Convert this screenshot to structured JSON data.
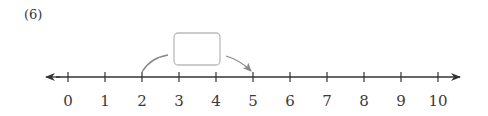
{
  "problem": {
    "number": "(6)"
  },
  "number_line": {
    "min": 0,
    "max": 10,
    "step": 1,
    "labels": [
      "0",
      "1",
      "2",
      "3",
      "4",
      "5",
      "6",
      "7",
      "8",
      "9",
      "10"
    ],
    "arrows": "both",
    "line_color": "#333333"
  },
  "jump": {
    "from": 2,
    "to": 5,
    "answer_box": "",
    "arc_color": "#888888",
    "box_border_color": "#bbbbbb"
  }
}
